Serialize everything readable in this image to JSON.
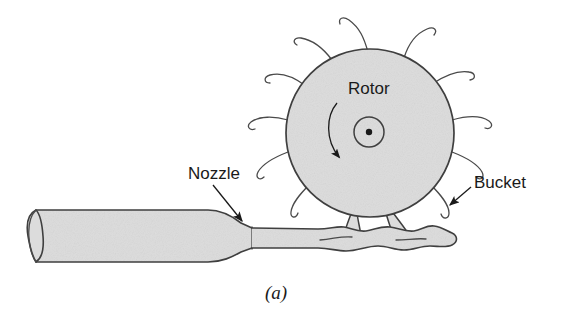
{
  "figure": {
    "caption": "(a)",
    "background_color": "#ffffff",
    "fill_color": "#dcdcdc",
    "outline_color": "#3f3f3f",
    "text_color": "#1a1a1a"
  },
  "labels": {
    "rotor": "Rotor",
    "nozzle": "Nozzle",
    "bucket": "Bucket"
  },
  "geometry": {
    "rotor": {
      "center_x": 370,
      "center_y": 133,
      "radius": 84,
      "hub_radius": 15,
      "axle_dot_radius": 3.2,
      "bucket_count": 14
    },
    "rotation_arrow": {
      "direction": "clockwise",
      "start_x": 338,
      "start_y": 104,
      "end_x": 344,
      "end_y": 160
    },
    "nozzle_pipe": {
      "left_x": 30,
      "right_x": 258,
      "top_y": 210,
      "bottom_y": 258,
      "cap_width": 13
    },
    "jet": {
      "start_x": 252,
      "end_x": 458,
      "center_y": 238
    },
    "labels_pos": {
      "rotor_x": 348,
      "rotor_y": 94,
      "nozzle_x": 188,
      "nozzle_y": 179,
      "bucket_x": 474,
      "bucket_y": 188,
      "caption_x": 265,
      "caption_y": 299
    }
  }
}
